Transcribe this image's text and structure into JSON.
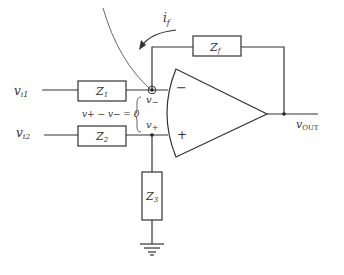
{
  "diagram": {
    "type": "op-amp circuit",
    "components": {
      "z1": {
        "label": "Z",
        "sub": "1"
      },
      "z2": {
        "label": "Z",
        "sub": "2"
      },
      "z3": {
        "label": "Z",
        "sub": "3"
      },
      "zf": {
        "label": "Z",
        "sub": "f"
      }
    },
    "inputs": {
      "vi1": {
        "label": "v",
        "sub": "i1"
      },
      "vi2": {
        "label": "v",
        "sub": "i2"
      }
    },
    "output": {
      "label": "v",
      "sub": "OUT"
    },
    "nodes": {
      "v_minus": {
        "label": "v",
        "sub": "−"
      },
      "v_plus": {
        "label": "v",
        "sub": "+"
      }
    },
    "opamp": {
      "minus_sign": "−",
      "plus_sign": "+"
    },
    "constraint": "v+ − v− = 0",
    "feedback_current": {
      "label": "i",
      "sub": "f"
    },
    "colors": {
      "line": "#333333",
      "background": "#ffffff"
    }
  }
}
